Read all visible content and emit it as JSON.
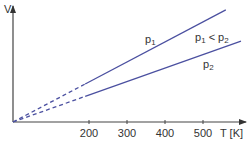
{
  "chart_data": {
    "type": "line",
    "title": "",
    "xlabel": "T [K]",
    "ylabel": "V",
    "xlim": [
      0,
      620
    ],
    "ylim": [
      0,
      1
    ],
    "x_ticks": [
      200,
      300,
      400,
      500
    ],
    "x_tick_labels": [
      "200",
      "300",
      "400",
      "500"
    ],
    "grid": false,
    "extrapolation_below_T": 190,
    "series": [
      {
        "name": "p1",
        "label_base": "p",
        "label_sub": "1",
        "x": [
          0,
          560
        ],
        "y": [
          0,
          0.966
        ],
        "color": "#4b50a0"
      },
      {
        "name": "p2",
        "label_base": "p",
        "label_sub": "2",
        "x": [
          0,
          600
        ],
        "y": [
          0,
          0.698
        ],
        "color": "#4b50a0"
      }
    ],
    "annotations": [
      {
        "text_parts": [
          "p",
          "1",
          " < p",
          "2"
        ],
        "meaning": "p1 < p2"
      }
    ],
    "axis_color": "#444444"
  }
}
